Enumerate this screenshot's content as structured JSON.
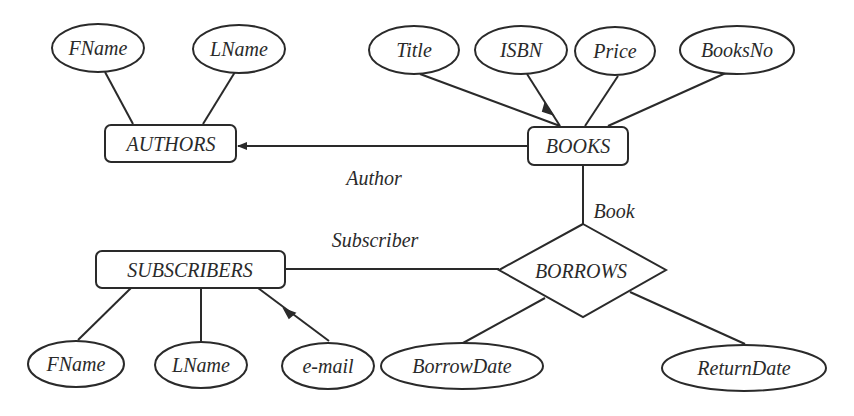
{
  "diagram": {
    "type": "er-diagram",
    "entities": [
      {
        "id": "authors",
        "label": "AUTHORS",
        "attributes": [
          "FName",
          "LName"
        ]
      },
      {
        "id": "books",
        "label": "BOOKS",
        "attributes": [
          "Title",
          "ISBN",
          "Price",
          "BooksNo"
        ]
      },
      {
        "id": "subscribers",
        "label": "SUBSCRIBERS",
        "attributes": [
          "FName",
          "LName",
          "e-mail"
        ]
      }
    ],
    "relationships": [
      {
        "id": "borrows",
        "label": "BORROWS",
        "attributes": [
          "BorrowDate",
          "ReturnDate"
        ]
      }
    ],
    "edge_labels": {
      "author": "Author",
      "book": "Book",
      "subscriber": "Subscriber"
    },
    "attributes": {
      "authors_fname": "FName",
      "authors_lname": "LName",
      "books_title": "Title",
      "books_isbn": "ISBN",
      "books_price": "Price",
      "books_booksno": "BooksNo",
      "subs_fname": "FName",
      "subs_lname": "LName",
      "subs_email": "e-mail",
      "borrow_date": "BorrowDate",
      "return_date": "ReturnDate"
    },
    "colors": {
      "stroke": "#2a2a2a",
      "background": "#ffffff"
    }
  }
}
